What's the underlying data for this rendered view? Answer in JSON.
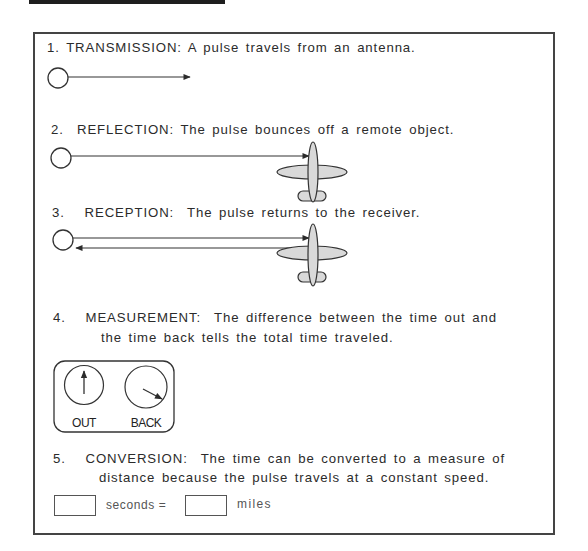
{
  "figure": {
    "steps": [
      {
        "number": "1.",
        "heading": "TRANSMISSION:",
        "text": "A pulse travels from an antenna."
      },
      {
        "number": "2.",
        "heading": "REFLECTION:",
        "text": "The pulse bounces off a remote object."
      },
      {
        "number": "3.",
        "heading": "RECEPTION:",
        "text": "The pulse returns to the receiver."
      },
      {
        "number": "4.",
        "heading": "MEASUREMENT:",
        "text": "The difference between the time out and",
        "text_line2": "the time back tells the total time traveled."
      },
      {
        "number": "5.",
        "heading": "CONVERSION:",
        "text": "The time can be converted to a measure of",
        "text_line2": "distance because the pulse travels at a constant speed."
      }
    ],
    "dials": {
      "out_label": "OUT",
      "back_label": "BACK"
    },
    "conversion": {
      "seconds_label": "seconds =",
      "miles_label": "miles",
      "seconds_value": "",
      "miles_value": ""
    },
    "colors": {
      "ink": "#2b2b2b",
      "airplane_fill": "#d9d9d9",
      "frame": "#444444"
    }
  }
}
